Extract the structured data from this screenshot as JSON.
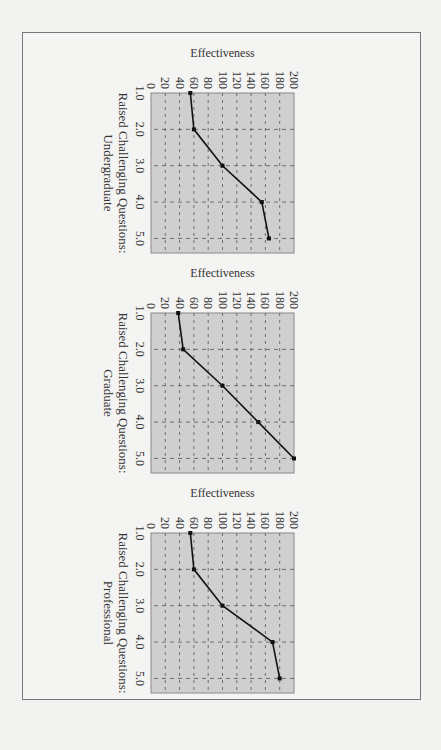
{
  "figure": {
    "layout": "three panels, page rotated 90° clockwise",
    "plot_background": "#cfcfcf",
    "grid_color": "#555555",
    "line_color": "#111111"
  },
  "chart_data": [
    {
      "type": "line",
      "title": "",
      "xlabel": "Raised Challenging Questions:",
      "xlabel_line2": "Undergraduate",
      "ylabel": "Effectiveness",
      "x": [
        1.0,
        2.0,
        3.0,
        4.0,
        5.0
      ],
      "x_tick_labels": [
        "1.0",
        "2.0",
        "3.0",
        "4.0",
        "5.0"
      ],
      "values": [
        55,
        60,
        100,
        155,
        165
      ],
      "ylim": [
        0,
        200
      ],
      "y_ticks": [
        0,
        20,
        40,
        60,
        80,
        100,
        120,
        140,
        160,
        180,
        200
      ],
      "y_tick_labels": [
        "0",
        "20",
        "40",
        "60",
        "80",
        "100",
        "120",
        "140",
        "160",
        "180",
        "200"
      ],
      "xlim": [
        1.0,
        5.4
      ],
      "grid": true,
      "legend": "none"
    },
    {
      "type": "line",
      "title": "",
      "xlabel": "Raised Challenging Questions:",
      "xlabel_line2": "Graduate",
      "ylabel": "Effectiveness",
      "x": [
        1.0,
        2.0,
        3.0,
        4.0,
        5.0
      ],
      "x_tick_labels": [
        "1.0",
        "2.0",
        "3.0",
        "4.0",
        "5.0"
      ],
      "values": [
        38,
        45,
        100,
        150,
        200
      ],
      "ylim": [
        0,
        200
      ],
      "y_ticks": [
        0,
        20,
        40,
        60,
        80,
        100,
        120,
        140,
        160,
        180,
        200
      ],
      "y_tick_labels": [
        "0",
        "20",
        "40",
        "60",
        "80",
        "100",
        "120",
        "140",
        "160",
        "180",
        "200"
      ],
      "xlim": [
        1.0,
        5.4
      ],
      "grid": true,
      "legend": "none"
    },
    {
      "type": "line",
      "title": "",
      "xlabel": "Raised Challenging Questions:",
      "xlabel_line2": "Professional",
      "ylabel": "Effectiveness",
      "x": [
        1.0,
        2.0,
        3.0,
        4.0,
        5.0
      ],
      "x_tick_labels": [
        "1.0",
        "2.0",
        "3.0",
        "4.0",
        "5.0"
      ],
      "values": [
        55,
        60,
        100,
        170,
        180
      ],
      "ylim": [
        0,
        200
      ],
      "y_ticks": [
        0,
        20,
        40,
        60,
        80,
        100,
        120,
        140,
        160,
        180,
        200
      ],
      "y_tick_labels": [
        "0",
        "20",
        "40",
        "60",
        "80",
        "100",
        "120",
        "140",
        "160",
        "180",
        "200"
      ],
      "xlim": [
        1.0,
        5.4
      ],
      "grid": true,
      "legend": "none"
    }
  ]
}
